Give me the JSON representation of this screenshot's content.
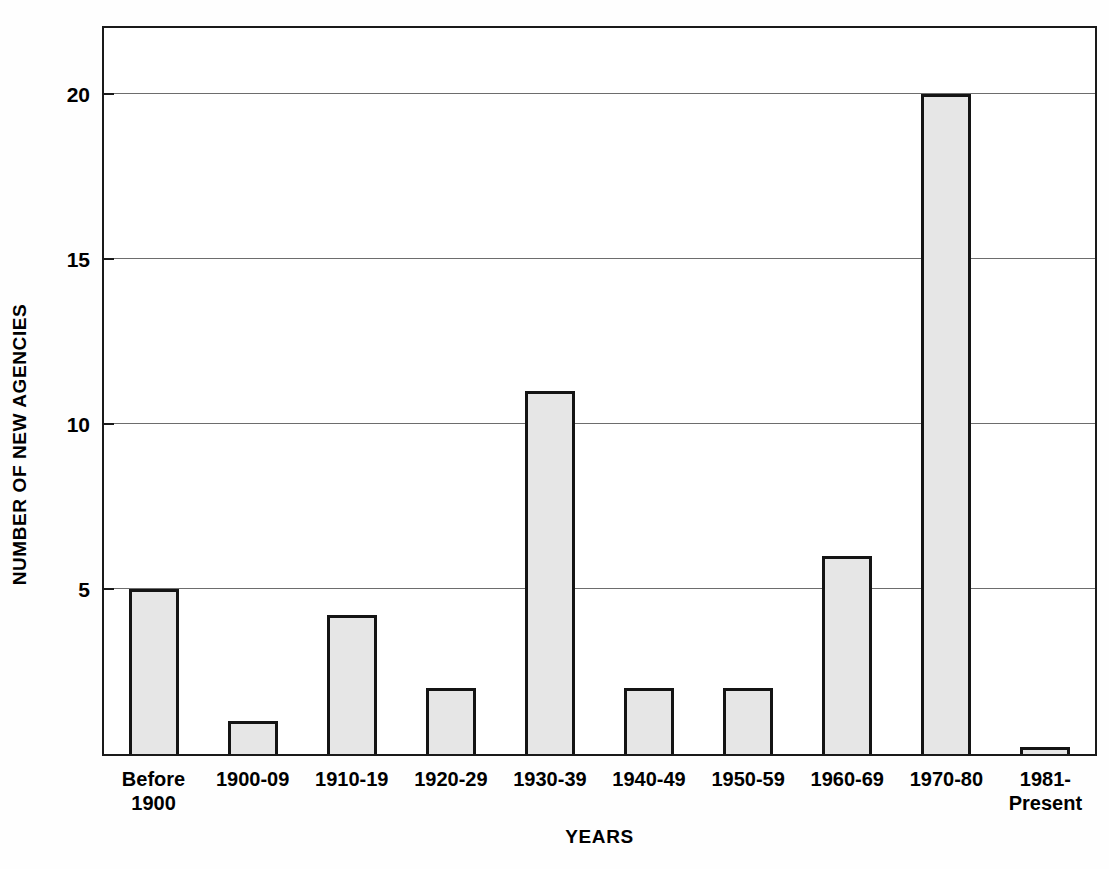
{
  "chart_data": {
    "type": "bar",
    "title": "",
    "subtitle": "",
    "xlabel": "YEARS",
    "ylabel": "NUMBER OF NEW AGENCIES",
    "categories": [
      "Before\n1900",
      "1900-09",
      "1910-19",
      "1920-29",
      "1930-39",
      "1940-49",
      "1950-59",
      "1960-69",
      "1970-80",
      "1981-\nPresent"
    ],
    "values": [
      5,
      1,
      4.2,
      2,
      11,
      2,
      2,
      6,
      20,
      0.2
    ],
    "ylim": [
      0,
      22
    ],
    "xlim_categories": 10,
    "y_ticks": [
      5,
      10,
      15,
      20
    ],
    "y_tick_labels": [
      "5",
      "10",
      "15",
      "20"
    ],
    "grid": "horizontal-major-only",
    "legend": "none",
    "legend_position": "none",
    "annotations": [],
    "colors": {
      "bar_fill": "#e6e6e6",
      "bar_border": "#141414",
      "gridline": "#6d6d6d",
      "axis": "#1a1a1a",
      "background": "#fefefe",
      "text": "#000000"
    }
  },
  "figure": {
    "y_axis_title": "NUMBER OF NEW AGENCIES",
    "x_axis_title": "YEARS"
  }
}
